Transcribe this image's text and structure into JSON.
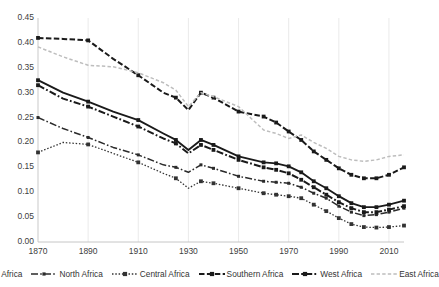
{
  "chart_data": {
    "type": "line",
    "title": "",
    "subtitle": "",
    "xlabel": "",
    "ylabel": "",
    "xlim": [
      1870,
      2016
    ],
    "ylim": [
      0.0,
      0.45
    ],
    "grid": true,
    "grid_axis": "x",
    "legend_position": "bottom",
    "x_ticks": [
      "1870",
      "1890",
      "1910",
      "1930",
      "1950",
      "1970",
      "1990",
      "2010"
    ],
    "x_tick_values": [
      1870,
      1890,
      1910,
      1930,
      1950,
      1970,
      1990,
      2010
    ],
    "y_ticks": [
      "0.00",
      "0.05",
      "0.10",
      "0.15",
      "0.20",
      "0.25",
      "0.30",
      "0.35",
      "0.40",
      "0.45"
    ],
    "y_tick_values": [
      0.0,
      0.05,
      0.1,
      0.15,
      0.2,
      0.25,
      0.3,
      0.35,
      0.4,
      0.45
    ],
    "x": [
      1870,
      1880,
      1890,
      1900,
      1910,
      1920,
      1925,
      1930,
      1935,
      1940,
      1950,
      1960,
      1965,
      1970,
      1975,
      1980,
      1985,
      1990,
      1995,
      2000,
      2005,
      2010,
      2016
    ],
    "series": [
      {
        "name": "Africa",
        "style": "solid",
        "color": "#1a1a1a",
        "marker": "square",
        "values": [
          0.325,
          0.3,
          0.282,
          0.262,
          0.245,
          0.218,
          0.205,
          0.185,
          0.205,
          0.195,
          0.172,
          0.16,
          0.158,
          0.152,
          0.14,
          0.122,
          0.108,
          0.092,
          0.078,
          0.07,
          0.07,
          0.075,
          0.083
        ]
      },
      {
        "name": "North Africa",
        "style": "dash-dot",
        "color": "#2b2b2b",
        "marker": "small-square",
        "values": [
          0.25,
          0.228,
          0.21,
          0.19,
          0.175,
          0.155,
          0.15,
          0.14,
          0.155,
          0.148,
          0.132,
          0.122,
          0.12,
          0.118,
          0.11,
          0.098,
          0.088,
          0.072,
          0.06,
          0.053,
          0.055,
          0.06,
          0.068
        ]
      },
      {
        "name": "Central Africa",
        "style": "dotted",
        "color": "#333333",
        "marker": "square",
        "values": [
          0.18,
          0.2,
          0.196,
          0.178,
          0.16,
          0.138,
          0.128,
          0.108,
          0.122,
          0.118,
          0.108,
          0.098,
          0.095,
          0.092,
          0.088,
          0.075,
          0.062,
          0.048,
          0.036,
          0.03,
          0.029,
          0.03,
          0.033
        ]
      },
      {
        "name": "Southern Africa",
        "style": "dashed-heavy",
        "color": "#1a1a1a",
        "marker": "square",
        "values": [
          0.41,
          0.408,
          0.405,
          0.368,
          0.335,
          0.3,
          0.29,
          0.265,
          0.3,
          0.29,
          0.262,
          0.252,
          0.24,
          0.222,
          0.205,
          0.182,
          0.165,
          0.148,
          0.135,
          0.128,
          0.128,
          0.135,
          0.15
        ]
      },
      {
        "name": "West Africa",
        "style": "dash-dot-heavy",
        "color": "#1a1a1a",
        "marker": "square",
        "values": [
          0.315,
          0.288,
          0.272,
          0.252,
          0.232,
          0.208,
          0.198,
          0.178,
          0.195,
          0.185,
          0.165,
          0.15,
          0.145,
          0.138,
          0.125,
          0.11,
          0.095,
          0.08,
          0.068,
          0.06,
          0.06,
          0.065,
          0.072
        ]
      },
      {
        "name": "East Africa",
        "style": "dotted-light",
        "color": "#bdbdbd",
        "marker": "none",
        "values": [
          0.392,
          0.372,
          0.355,
          0.352,
          0.34,
          0.32,
          0.305,
          0.272,
          0.3,
          0.292,
          0.272,
          0.225,
          0.218,
          0.208,
          0.215,
          0.2,
          0.188,
          0.172,
          0.165,
          0.162,
          0.165,
          0.172,
          0.175
        ]
      }
    ],
    "legend": [
      {
        "label": "Africa",
        "swatch": "solid-square"
      },
      {
        "label": "North Africa",
        "swatch": "dash-dot-small"
      },
      {
        "label": "Central Africa",
        "swatch": "dotted-square"
      },
      {
        "label": "Southern Africa",
        "swatch": "dashed-square"
      },
      {
        "label": "West Africa",
        "swatch": "dash-dot-heavy"
      },
      {
        "label": "East Africa",
        "swatch": "dotted-light"
      }
    ]
  },
  "axes": {
    "y_labels": [
      "0.45",
      "0.40",
      "0.35",
      "0.30",
      "0.25",
      "0.20",
      "0.15",
      "0.10",
      "0.05",
      "0.00"
    ],
    "x_labels": [
      "1870",
      "1890",
      "1910",
      "1930",
      "1950",
      "1970",
      "1990",
      "2010"
    ]
  }
}
